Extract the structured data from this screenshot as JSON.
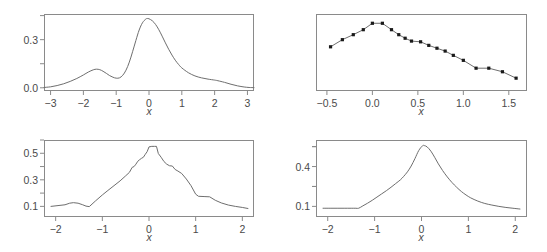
{
  "figure": {
    "background": "#ffffff",
    "axis_color": "#8a8a8a",
    "curve_color": "#6e6e6e",
    "point_color": "#1a1a1a",
    "text_color": "#4a4a4a",
    "layout": "2x2 grid of plot panels"
  },
  "chart_data": [
    {
      "id": "top-left",
      "type": "line",
      "title": "",
      "subtitle": "",
      "xlabel": "x",
      "ylabel": "",
      "grid": false,
      "legend": null,
      "xlim": [
        -3.2,
        3.2
      ],
      "ylim": [
        -0.02,
        0.46
      ],
      "xticks": [
        -3,
        -2,
        -1,
        0,
        1,
        2,
        3
      ],
      "xticklabels": [
        "−3",
        "−2",
        "−1",
        "0",
        "1",
        "2",
        "3"
      ],
      "yticks": [
        0.0,
        0.3
      ],
      "yticklabels": [
        "0.0",
        "0.3"
      ],
      "yticks_minor": [
        0.15,
        0.45
      ],
      "description": "bimodal kernel density estimate, small left mode near x=-1.6, tall main mode near x=-0.05",
      "series": [
        {
          "name": "density",
          "x": [
            -3.2,
            -3.0,
            -2.8,
            -2.6,
            -2.4,
            -2.2,
            -2.0,
            -1.85,
            -1.7,
            -1.6,
            -1.5,
            -1.4,
            -1.3,
            -1.2,
            -1.1,
            -1.0,
            -0.9,
            -0.8,
            -0.7,
            -0.6,
            -0.5,
            -0.4,
            -0.3,
            -0.2,
            -0.1,
            -0.05,
            0.0,
            0.1,
            0.2,
            0.3,
            0.4,
            0.5,
            0.6,
            0.7,
            0.8,
            0.9,
            1.0,
            1.2,
            1.4,
            1.6,
            1.8,
            2.0,
            2.1,
            2.3,
            2.5,
            2.7,
            2.9,
            3.05,
            3.2
          ],
          "y": [
            0.002,
            0.006,
            0.014,
            0.025,
            0.04,
            0.058,
            0.08,
            0.098,
            0.112,
            0.116,
            0.113,
            0.103,
            0.09,
            0.076,
            0.066,
            0.06,
            0.062,
            0.078,
            0.11,
            0.16,
            0.225,
            0.295,
            0.36,
            0.405,
            0.428,
            0.432,
            0.43,
            0.418,
            0.395,
            0.362,
            0.322,
            0.28,
            0.24,
            0.204,
            0.172,
            0.146,
            0.124,
            0.094,
            0.074,
            0.062,
            0.054,
            0.048,
            0.044,
            0.034,
            0.022,
            0.012,
            0.005,
            0.002,
            0.001
          ]
        }
      ]
    },
    {
      "id": "top-right",
      "type": "line",
      "title": "",
      "subtitle": "",
      "xlabel": "x",
      "ylabel": "",
      "grid": false,
      "legend": null,
      "xlim": [
        -0.62,
        1.7
      ],
      "ylim": [
        0.0,
        1.08
      ],
      "xticks": [
        -0.5,
        0.0,
        0.5,
        1.0,
        1.5
      ],
      "xticklabels": [
        "−0.5",
        "0.0",
        "0.5",
        "1.0",
        "1.5"
      ],
      "yticks": [],
      "yticklabels": [],
      "markers": true,
      "description": "piecewise line with filled square markers, rises to a flat peak near x=0.0 to 0.11 then declines to x=1.6",
      "series": [
        {
          "name": "profile",
          "x": [
            -0.46,
            -0.33,
            -0.21,
            -0.1,
            0.0,
            0.11,
            0.21,
            0.29,
            0.36,
            0.43,
            0.53,
            0.62,
            0.71,
            0.8,
            0.89,
            1.0,
            1.14,
            1.28,
            1.43,
            1.58
          ],
          "y": [
            0.62,
            0.72,
            0.79,
            0.86,
            0.95,
            0.95,
            0.86,
            0.79,
            0.74,
            0.7,
            0.69,
            0.64,
            0.6,
            0.56,
            0.5,
            0.43,
            0.32,
            0.32,
            0.27,
            0.18
          ]
        }
      ]
    },
    {
      "id": "bottom-left",
      "type": "line",
      "title": "",
      "subtitle": "",
      "xlabel": "x",
      "ylabel": "",
      "grid": false,
      "legend": null,
      "xlim": [
        -2.25,
        2.25
      ],
      "ylim": [
        0.02,
        0.6
      ],
      "xticks": [
        -2,
        -1,
        0,
        1,
        2
      ],
      "xticklabels": [
        "−2",
        "−1",
        "0",
        "1",
        "2"
      ],
      "yticks": [
        0.1,
        0.3,
        0.5
      ],
      "yticklabels": [
        "0.1",
        "0.3",
        "0.5"
      ],
      "description": "jagged piecewise-linear density with flat plateau near the mode around x=0 to 0.15",
      "series": [
        {
          "name": "density",
          "x": [
            -2.1,
            -1.95,
            -1.8,
            -1.7,
            -1.62,
            -1.52,
            -1.42,
            -1.35,
            -1.28,
            -1.15,
            -1.0,
            -0.88,
            -0.75,
            -0.62,
            -0.5,
            -0.42,
            -0.36,
            -0.32,
            -0.28,
            -0.24,
            -0.2,
            -0.16,
            -0.12,
            -0.08,
            -0.04,
            0.0,
            0.06,
            0.12,
            0.16,
            0.2,
            0.26,
            0.32,
            0.38,
            0.44,
            0.5,
            0.56,
            0.62,
            0.7,
            0.8,
            0.9,
            1.0,
            1.06,
            1.18,
            1.3,
            1.42,
            1.55,
            1.7,
            1.85,
            2.0,
            2.12
          ],
          "y": [
            0.1,
            0.106,
            0.112,
            0.124,
            0.128,
            0.124,
            0.112,
            0.102,
            0.098,
            0.14,
            0.186,
            0.22,
            0.256,
            0.292,
            0.33,
            0.356,
            0.394,
            0.4,
            0.418,
            0.44,
            0.452,
            0.462,
            0.47,
            0.492,
            0.512,
            0.548,
            0.552,
            0.552,
            0.552,
            0.498,
            0.47,
            0.438,
            0.418,
            0.406,
            0.404,
            0.378,
            0.366,
            0.348,
            0.306,
            0.256,
            0.192,
            0.176,
            0.174,
            0.172,
            0.146,
            0.126,
            0.11,
            0.1,
            0.092,
            0.084
          ]
        }
      ]
    },
    {
      "id": "bottom-right",
      "type": "line",
      "title": "",
      "subtitle": "",
      "xlabel": "x",
      "ylabel": "",
      "grid": false,
      "legend": null,
      "xlim": [
        -2.25,
        2.25
      ],
      "ylim": [
        0.02,
        0.6
      ],
      "xticks": [
        -2,
        -1,
        0,
        1,
        2
      ],
      "xticklabels": [
        "−2",
        "−1",
        "0",
        "1",
        "2"
      ],
      "yticks": [
        0.1,
        0.4
      ],
      "yticklabels": [
        "0.1",
        "0.4"
      ],
      "yticks_minor": [
        0.25,
        0.55
      ],
      "description": "smooth unimodal density peaking near x=0.05, flat left tail below x=-1.35",
      "series": [
        {
          "name": "density",
          "x": [
            -2.1,
            -1.95,
            -1.8,
            -1.65,
            -1.5,
            -1.4,
            -1.34,
            -1.25,
            -1.15,
            -1.05,
            -0.95,
            -0.85,
            -0.75,
            -0.65,
            -0.55,
            -0.45,
            -0.38,
            -0.3,
            -0.22,
            -0.14,
            -0.06,
            0.02,
            0.06,
            0.12,
            0.2,
            0.28,
            0.36,
            0.45,
            0.55,
            0.65,
            0.75,
            0.85,
            0.95,
            1.05,
            1.2,
            1.35,
            1.5,
            1.65,
            1.8,
            1.95,
            2.1
          ],
          "y": [
            0.086,
            0.086,
            0.086,
            0.086,
            0.086,
            0.086,
            0.086,
            0.104,
            0.124,
            0.146,
            0.17,
            0.194,
            0.218,
            0.244,
            0.272,
            0.3,
            0.326,
            0.36,
            0.404,
            0.46,
            0.52,
            0.556,
            0.558,
            0.548,
            0.516,
            0.47,
            0.42,
            0.37,
            0.322,
            0.28,
            0.244,
            0.212,
            0.186,
            0.164,
            0.14,
            0.122,
            0.11,
            0.1,
            0.092,
            0.086,
            0.08
          ]
        }
      ]
    }
  ],
  "panels": {
    "top_left": {
      "xlabel": "x",
      "xticklabels": [
        "−3",
        "−2",
        "−1",
        "0",
        "1",
        "2",
        "3"
      ],
      "yticklabels": [
        "0.0",
        "0.3"
      ]
    },
    "top_right": {
      "xlabel": "x",
      "xticklabels": [
        "−0.5",
        "0.0",
        "0.5",
        "1.0",
        "1.5"
      ],
      "yticklabels": []
    },
    "bottom_left": {
      "xlabel": "x",
      "xticklabels": [
        "−2",
        "−1",
        "0",
        "1",
        "2"
      ],
      "yticklabels": [
        "0.1",
        "0.3",
        "0.5"
      ]
    },
    "bottom_right": {
      "xlabel": "x",
      "xticklabels": [
        "−2",
        "−1",
        "0",
        "1",
        "2"
      ],
      "yticklabels": [
        "0.1",
        "0.4"
      ]
    }
  }
}
